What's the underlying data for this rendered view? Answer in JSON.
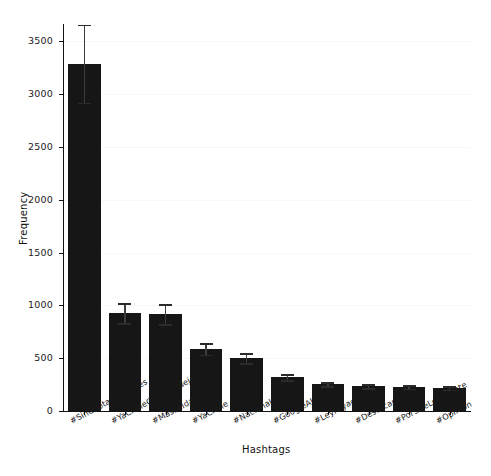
{
  "chart_data": {
    "type": "bar",
    "title": "",
    "xlabel": "Hashtags",
    "ylabel": "Frequency",
    "categories": [
      "#SinCuotasNiCuates",
      "#YaCholeConTusQuejas",
      "#MásLeídas",
      "#YaChole",
      "#Nacional",
      "#GoogleAlerts",
      "#LeyFayad",
      "#Destacadas",
      "#PorSiTeLoPerdiste",
      "#Opinión"
    ],
    "values": [
      3290,
      925,
      915,
      590,
      500,
      320,
      255,
      235,
      230,
      220
    ],
    "errors": [
      370,
      95,
      95,
      55,
      45,
      30,
      20,
      18,
      18,
      18
    ],
    "yticks": [
      0,
      500,
      1000,
      1500,
      2000,
      2500,
      3000,
      3500
    ],
    "ytick_labels": [
      "0",
      "500",
      "1000",
      "1500",
      "2000",
      "2500",
      "3000",
      "3500"
    ],
    "ylim": [
      0,
      3665
    ],
    "xlim": [
      0,
      10
    ],
    "grid": true,
    "grid_axis": "y",
    "legend": false,
    "bar_color": "#161616",
    "error_color": "#3d3d3d",
    "background_color": "#ffffff",
    "gridline_color": "#f7f7f7",
    "axis_color": "#111111",
    "xtick_rotation": -28
  }
}
